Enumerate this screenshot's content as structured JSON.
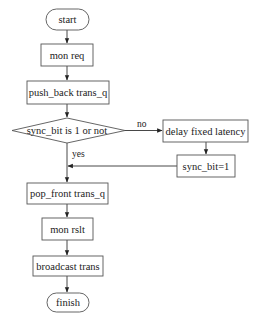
{
  "diagram": {
    "type": "flowchart",
    "nodes": {
      "start": {
        "label": "start",
        "shape": "terminator"
      },
      "mon_req": {
        "label": "mon req",
        "shape": "process"
      },
      "push_back": {
        "label": "push_back trans_q",
        "shape": "process"
      },
      "decision": {
        "label": "sync_bit is 1 or not",
        "shape": "decision"
      },
      "delay": {
        "label": "delay fixed latency",
        "shape": "process"
      },
      "sync_set": {
        "label": "sync_bit=1",
        "shape": "process"
      },
      "pop_front": {
        "label": "pop_front trans_q",
        "shape": "process"
      },
      "mon_rslt": {
        "label": "mon rslt",
        "shape": "process"
      },
      "broadcast": {
        "label": "broadcast trans",
        "shape": "process"
      },
      "finish": {
        "label": "finish",
        "shape": "terminator"
      }
    },
    "edges": {
      "no_label": "no",
      "yes_label": "yes"
    },
    "edge_list": [
      {
        "from": "start",
        "to": "mon_req"
      },
      {
        "from": "mon_req",
        "to": "push_back"
      },
      {
        "from": "push_back",
        "to": "decision"
      },
      {
        "from": "decision",
        "to": "delay",
        "label": "no"
      },
      {
        "from": "delay",
        "to": "sync_set"
      },
      {
        "from": "sync_set",
        "to": "pop_front"
      },
      {
        "from": "decision",
        "to": "pop_front",
        "label": "yes"
      },
      {
        "from": "pop_front",
        "to": "mon_rslt"
      },
      {
        "from": "mon_rslt",
        "to": "broadcast"
      },
      {
        "from": "broadcast",
        "to": "finish"
      }
    ]
  }
}
